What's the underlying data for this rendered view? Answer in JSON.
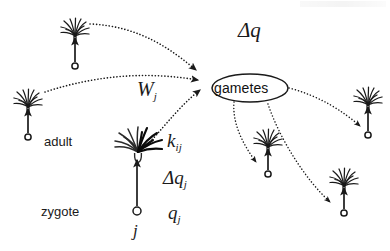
{
  "figure": {
    "domain": "Diagram",
    "width": 390,
    "height": 251,
    "background": "#ffffff",
    "ink_color": "#1a1a1a"
  },
  "hub": {
    "label": "gametes",
    "shape": "ellipse",
    "cx": 250,
    "cy": 88,
    "rx": 38,
    "ry": 14
  },
  "labels": {
    "delta_q": "Δq",
    "w_j": "W",
    "w_j_sub": "j",
    "k_ij": "k",
    "k_ij_sub": "ij",
    "delta_q_j": "Δq",
    "delta_q_j_sub": "j",
    "q_j": "q",
    "q_j_sub": "j",
    "j": "j",
    "adult": "adult",
    "zygote": "zygote"
  },
  "palms": [
    {
      "name": "palm-top-left",
      "tree_x": 75,
      "tree_y": 18,
      "circle_x": 75,
      "circle_y": 66,
      "size": 1.0
    },
    {
      "name": "palm-far-left",
      "tree_x": 28,
      "tree_y": 90,
      "circle_x": 28,
      "circle_y": 137,
      "size": 1.0
    },
    {
      "name": "palm-right",
      "tree_x": 368,
      "tree_y": 88,
      "circle_x": 368,
      "circle_y": 135,
      "size": 1.0
    },
    {
      "name": "palm-lower-middle",
      "tree_x": 268,
      "tree_y": 130,
      "circle_x": 268,
      "circle_y": 174,
      "size": 1.0
    },
    {
      "name": "palm-lower-right",
      "tree_x": 344,
      "tree_y": 168,
      "circle_x": 344,
      "circle_y": 213,
      "size": 1.0
    }
  ],
  "focal_column": {
    "name": "focal-adult-column",
    "adult_tree_x": 137,
    "adult_tree_y": 140,
    "zygote_circle_x": 137,
    "zygote_circle_y": 212
  },
  "flows_in": [
    {
      "name": "flow-in-from-top-left",
      "from": "palm-top-left",
      "to": "gametes"
    },
    {
      "name": "flow-in-from-far-left",
      "from": "palm-far-left",
      "to": "gametes"
    },
    {
      "name": "flow-in-from-focal",
      "from": "focal-adult",
      "to": "gametes",
      "weight": "W_j"
    }
  ],
  "flows_out": [
    {
      "name": "flow-out-to-lower-middle",
      "from": "gametes",
      "to": "palm-lower-middle"
    },
    {
      "name": "flow-out-to-lower-right",
      "from": "gametes",
      "to": "palm-lower-right"
    },
    {
      "name": "flow-out-to-right",
      "from": "gametes",
      "to": "palm-right"
    }
  ],
  "growth_arrows": [
    {
      "name": "growth-arrow-top-left",
      "x": 75,
      "y1": 62,
      "y2": 36
    },
    {
      "name": "growth-arrow-far-left",
      "x": 28,
      "y1": 133,
      "y2": 107
    },
    {
      "name": "growth-arrow-right",
      "x": 368,
      "y1": 131,
      "y2": 105
    },
    {
      "name": "growth-arrow-lower-middle",
      "x": 268,
      "y1": 170,
      "y2": 147
    },
    {
      "name": "growth-arrow-lower-right",
      "x": 344,
      "y1": 209,
      "y2": 186
    },
    {
      "name": "growth-arrow-focal",
      "x": 137,
      "y1": 206,
      "y2": 158
    }
  ]
}
